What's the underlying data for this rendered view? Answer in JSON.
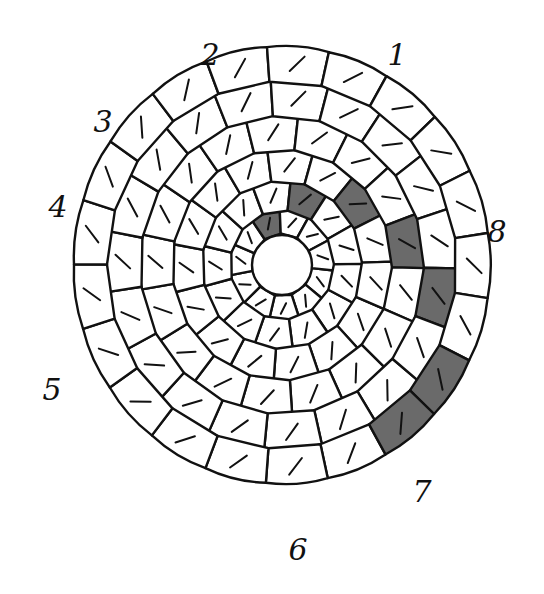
{
  "figure": {
    "center": [
      282,
      265
    ],
    "colors": {
      "outline": "#111111",
      "cell_fill": "#ffffff",
      "shaded_fill": "#6a6a6a",
      "background": "#ffffff"
    }
  },
  "labels": [
    {
      "id": "1",
      "text": "1",
      "x": 397,
      "y": 55
    },
    {
      "id": "2",
      "text": "2",
      "x": 210,
      "y": 55
    },
    {
      "id": "3",
      "text": "3",
      "x": 103,
      "y": 122
    },
    {
      "id": "4",
      "text": "4",
      "x": 58,
      "y": 207
    },
    {
      "id": "5",
      "text": "5",
      "x": 52,
      "y": 390
    },
    {
      "id": "6",
      "text": "6",
      "x": 298,
      "y": 550
    },
    {
      "id": "7",
      "text": "7",
      "x": 422,
      "y": 492
    },
    {
      "id": "8",
      "text": "8",
      "x": 497,
      "y": 232
    }
  ]
}
